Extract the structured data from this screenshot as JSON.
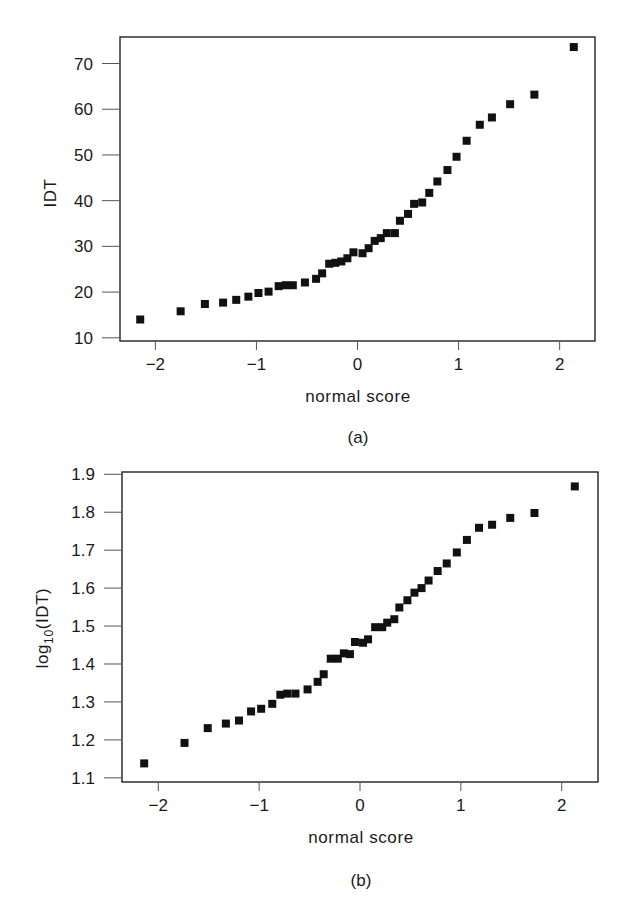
{
  "chart_data": [
    {
      "id": "a",
      "type": "scatter",
      "title": "",
      "caption": "(a)",
      "xlabel": "normal score",
      "ylabel": "IDT",
      "ylabel_sub": "",
      "ylabel_suffix": "",
      "xlim": [
        -2.35,
        2.35
      ],
      "ylim": [
        9.3,
        75.8
      ],
      "xticks": [
        -2,
        -1,
        0,
        1,
        2
      ],
      "xtick_labels": [
        "−2",
        "−1",
        "0",
        "1",
        "2"
      ],
      "yticks": [
        10,
        20,
        30,
        40,
        50,
        60,
        70
      ],
      "ytick_labels": [
        "10",
        "20",
        "30",
        "40",
        "50",
        "60",
        "70"
      ],
      "grid": false,
      "marker": "square",
      "color": "#111111",
      "frame": {
        "left": 120,
        "top": 37,
        "right": 595,
        "bottom": 341
      },
      "x": [
        -2.15,
        -1.75,
        -1.51,
        -1.33,
        -1.2,
        -1.08,
        -0.98,
        -0.88,
        -0.78,
        -0.71,
        -0.64,
        -0.52,
        -0.41,
        -0.35,
        -0.28,
        -0.22,
        -0.16,
        -0.1,
        -0.04,
        0.05,
        0.11,
        0.17,
        0.23,
        0.29,
        0.37,
        0.42,
        0.5,
        0.56,
        0.64,
        0.71,
        0.79,
        0.89,
        0.98,
        1.08,
        1.21,
        1.33,
        1.51,
        1.75,
        2.14
      ],
      "y": [
        14.0,
        15.8,
        17.4,
        17.7,
        18.3,
        19.0,
        19.8,
        20.1,
        21.3,
        21.5,
        21.5,
        22.1,
        22.9,
        24.1,
        26.2,
        26.4,
        26.7,
        27.4,
        28.7,
        28.5,
        29.6,
        31.2,
        31.8,
        32.9,
        32.9,
        35.6,
        37.1,
        39.3,
        39.6,
        41.7,
        44.2,
        46.7,
        49.6,
        53.1,
        56.6,
        58.2,
        61.1,
        63.2,
        73.6
      ]
    },
    {
      "id": "b",
      "type": "scatter",
      "title": "",
      "caption": "(b)",
      "xlabel": "normal score",
      "ylabel": "log",
      "ylabel_sub": "10",
      "ylabel_suffix": "(IDT)",
      "xlim": [
        -2.36,
        2.36
      ],
      "ylim": [
        1.089,
        1.906
      ],
      "xticks": [
        -2,
        -1,
        0,
        1,
        2
      ],
      "xtick_labels": [
        "−2",
        "−1",
        "0",
        "1",
        "2"
      ],
      "yticks": [
        1.1,
        1.2,
        1.3,
        1.4,
        1.5,
        1.6,
        1.7,
        1.8,
        1.9
      ],
      "ytick_labels": [
        "1.1",
        "1.2",
        "1.3",
        "1.4",
        "1.5",
        "1.6",
        "1.7",
        "1.8",
        "1.9"
      ],
      "grid": false,
      "marker": "square",
      "color": "#111111",
      "frame": {
        "left": 122,
        "top": 472,
        "right": 598,
        "bottom": 782
      },
      "x": [
        -2.14,
        -1.74,
        -1.51,
        -1.33,
        -1.2,
        -1.08,
        -0.98,
        -0.87,
        -0.79,
        -0.72,
        -0.64,
        -0.52,
        -0.42,
        -0.36,
        -0.29,
        -0.22,
        -0.16,
        -0.1,
        -0.05,
        0.03,
        0.08,
        0.15,
        0.22,
        0.27,
        0.34,
        0.39,
        0.47,
        0.54,
        0.61,
        0.68,
        0.77,
        0.86,
        0.96,
        1.06,
        1.18,
        1.31,
        1.49,
        1.73,
        2.13
      ],
      "y": [
        1.138,
        1.192,
        1.231,
        1.243,
        1.251,
        1.275,
        1.282,
        1.295,
        1.319,
        1.322,
        1.322,
        1.333,
        1.353,
        1.373,
        1.414,
        1.414,
        1.428,
        1.426,
        1.458,
        1.456,
        1.465,
        1.497,
        1.497,
        1.509,
        1.518,
        1.549,
        1.568,
        1.588,
        1.6,
        1.62,
        1.645,
        1.665,
        1.694,
        1.727,
        1.759,
        1.767,
        1.785,
        1.798,
        1.868
      ]
    }
  ]
}
